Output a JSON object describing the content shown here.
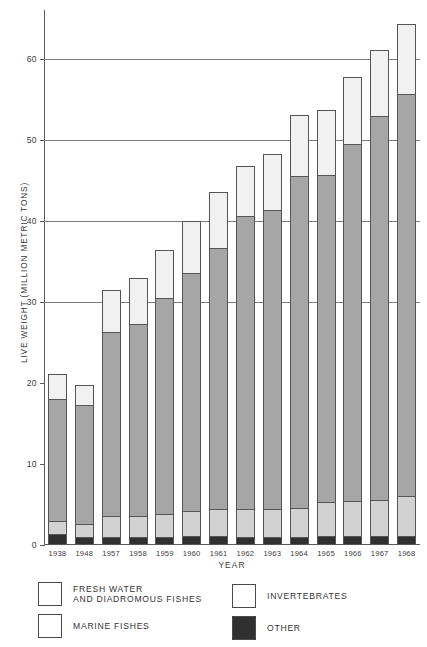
{
  "chart_data": {
    "type": "bar",
    "stacked": true,
    "title": "",
    "xlabel": "YEAR",
    "ylabel": "LIVE WEIGHT (MILLION METRIC TONS)",
    "ylim": [
      0,
      66
    ],
    "yticks": [
      0,
      10,
      20,
      30,
      40,
      50,
      60
    ],
    "ytick_labels": [
      "0",
      "10",
      "20",
      "30",
      "40",
      "50",
      "60"
    ],
    "gridlines": [
      30,
      40,
      50,
      60
    ],
    "grid": true,
    "legend_position": "below",
    "categories": [
      "1938",
      "1948",
      "1957",
      "1958",
      "1959",
      "1960",
      "1961",
      "1962",
      "1963",
      "1964",
      "1965",
      "1966",
      "1967",
      "1968"
    ],
    "series": [
      {
        "name": "OTHER",
        "color": "#303030",
        "values": [
          1.3,
          1.0,
          1.0,
          1.0,
          1.0,
          1.1,
          1.1,
          1.0,
          1.0,
          1.0,
          1.1,
          1.1,
          1.1,
          1.1
        ]
      },
      {
        "name": "FRESH WATER AND DIADROMOUS FISHES",
        "color": "#d2d2d2",
        "values": [
          1.7,
          1.6,
          2.6,
          2.6,
          2.8,
          3.1,
          3.3,
          3.4,
          3.5,
          3.6,
          4.2,
          4.3,
          4.5,
          4.9
        ]
      },
      {
        "name": "MARINE FISHES",
        "color": "#a6a6a6",
        "values": [
          15.0,
          14.7,
          22.7,
          23.7,
          26.7,
          29.4,
          32.3,
          36.2,
          36.8,
          40.9,
          40.4,
          44.1,
          47.3,
          49.7
        ]
      },
      {
        "name": "INVERTEBRATES",
        "color": "#f1f1f1",
        "values": [
          3.1,
          2.4,
          5.2,
          5.6,
          5.9,
          6.4,
          6.8,
          6.1,
          7.0,
          7.6,
          8.0,
          8.2,
          8.2,
          8.6
        ]
      }
    ],
    "totals": [
      21.1,
      19.7,
      31.5,
      32.9,
      36.4,
      40.0,
      43.5,
      46.7,
      48.3,
      53.1,
      53.7,
      57.7,
      61.1,
      64.3
    ]
  },
  "legend": {
    "items": [
      {
        "label_lines": [
          "FRESH WATER",
          "AND DIADROMOUS FISHES"
        ],
        "swatch": "#ffffff"
      },
      {
        "label_lines": [
          "INVERTEBRATES"
        ],
        "swatch": "#ffffff"
      },
      {
        "label_lines": [
          "MARINE FISHES"
        ],
        "swatch": "#ffffff"
      },
      {
        "label_lines": [
          "OTHER"
        ],
        "swatch": "#303030"
      }
    ]
  },
  "caption": {
    "text": ""
  }
}
